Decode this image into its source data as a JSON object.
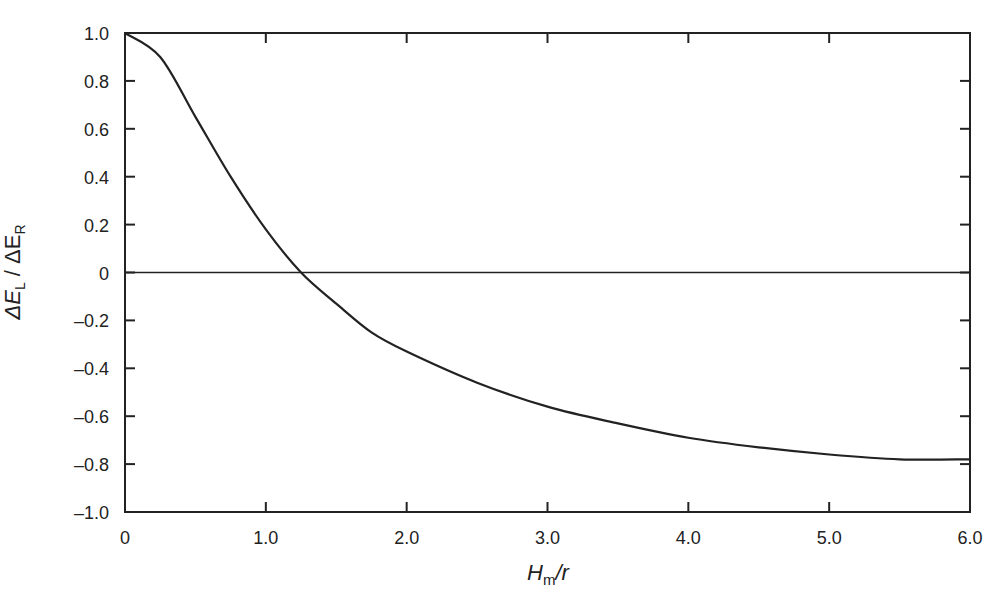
{
  "chart_data": {
    "type": "line",
    "title": "",
    "xlabel": "H_m/r",
    "ylabel": "ΔE_L / ΔE_R",
    "xlim": [
      0,
      6.0
    ],
    "ylim": [
      -1.0,
      1.0
    ],
    "x_ticks": [
      "0",
      "1.0",
      "2.0",
      "3.0",
      "4.0",
      "5.0",
      "6.0"
    ],
    "y_ticks": [
      "1.0",
      "0.8",
      "0.6",
      "0.4",
      "0.2",
      "0",
      "-0.2",
      "-0.4",
      "-0.6",
      "-0.8",
      "-1.0"
    ],
    "grid": false,
    "reference_line": {
      "y": 0
    },
    "series": [
      {
        "name": "ΔE_L / ΔE_R",
        "x": [
          0,
          0.25,
          0.5,
          0.75,
          1.0,
          1.25,
          1.5,
          1.75,
          2.0,
          2.5,
          3.0,
          3.5,
          4.0,
          4.5,
          5.0,
          5.5,
          6.0
        ],
        "values": [
          1.0,
          0.9,
          0.65,
          0.4,
          0.18,
          0.0,
          -0.13,
          -0.25,
          -0.33,
          -0.46,
          -0.56,
          -0.63,
          -0.69,
          -0.73,
          -0.76,
          -0.78,
          -0.78
        ]
      }
    ]
  },
  "labels": {
    "x_main": "H",
    "x_sub": "m",
    "x_tail": "/r",
    "y_part1": "ΔE",
    "y_sub1": "L",
    "y_mid": " / ΔE",
    "y_sub2": "R"
  }
}
